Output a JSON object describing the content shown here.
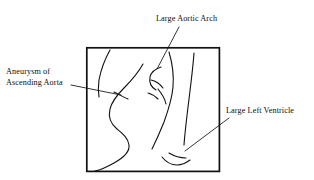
{
  "figure": {
    "kind": "annotated-line-drawing",
    "background_color": "#ffffff",
    "ink_color": "#111111",
    "frame": {
      "label": "image-border",
      "x": 86,
      "y": 47,
      "width": 134,
      "height": 125,
      "stroke_width": 1.6,
      "color": "#111111"
    }
  },
  "annotations": [
    {
      "id": "aortic-arch",
      "name": "Large Aortic Arch",
      "text_lines": [
        "Large Aortic Arch"
      ],
      "position": "top",
      "leader": {
        "from_x": 178,
        "from_y": 27,
        "to_x": 158,
        "to_y": 68
      }
    },
    {
      "id": "aneurysm-ascending-aorta",
      "name": "Aneurysm of Ascending Aorta",
      "text_lines": [
        "Aneurysm of",
        "Ascending Aorta"
      ],
      "position": "left",
      "leader": {
        "from_x": 72,
        "from_y": 85,
        "to_x": 120,
        "to_y": 94
      }
    },
    {
      "id": "large-left-ventricle",
      "name": "Large Left Ventricle",
      "text_lines": [
        "Large Left Ventricle"
      ],
      "position": "right",
      "leader": {
        "from_x": 228,
        "from_y": 118,
        "to_x": 186,
        "to_y": 150
      }
    }
  ],
  "strokes": {
    "upper_left_vessel": "M 109 50 C 105 58, 101 68, 99 80 C 98 86, 98 90, 99 96",
    "left_heart_border": "M 142 64 C 137 72, 131 80, 124 87 C 117 94, 112 100, 110 108 C 108 116, 111 123, 117 128 C 123 133, 128 137, 129 144 C 130 151, 124 157, 115 162 C 108 166, 101 169, 96 170",
    "left_tick_short": "M 116 93 C 119 95, 123 97, 127 98",
    "aortic_knob": "M 160 67 C 155 69, 151 72, 150 77 C 149 82, 151 86, 155 89",
    "arch_inner_hook": "M 152 79 C 157 80, 161 83, 163 87",
    "pulmonary_segment": "M 157 88 C 161 93, 164 98, 165 103",
    "right_heart_border": "M 168 52 C 171 62, 173 74, 172 86 C 171 98, 168 110, 164 121 C 160 131, 156 140, 153 148",
    "outer_right_edge": "M 193 53 C 192 66, 190 82, 188 98 C 186 114, 184 130, 183 144",
    "diaphragm_right": "M 170 152 C 175 155, 180 157, 186 157",
    "diaphragm_hook": "M 163 156 C 167 161, 172 164, 178 164 C 182 164, 186 162, 189 159",
    "small_left_arc": "M 148 93 C 152 94, 155 96, 157 99"
  }
}
